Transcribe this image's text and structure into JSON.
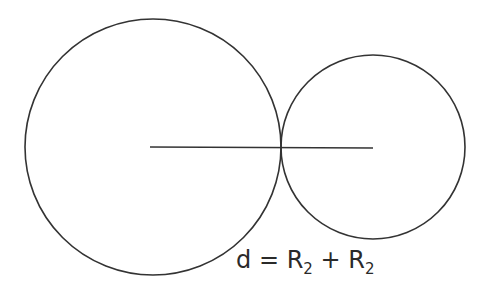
{
  "diagram": {
    "type": "tangent-circles",
    "stroke_color": "#333333",
    "large_circle": {
      "cx": 153,
      "cy": 147,
      "r": 128
    },
    "small_circle": {
      "cx": 373,
      "cy": 147,
      "r": 92
    },
    "center_line": {
      "x1": 150,
      "y1": 147,
      "x2": 373,
      "y2": 148
    },
    "formula": {
      "lhs": "d",
      "eq": "=",
      "term1": "R",
      "sub1": "2",
      "op": "+",
      "term2": "R",
      "sub2": "2"
    }
  }
}
